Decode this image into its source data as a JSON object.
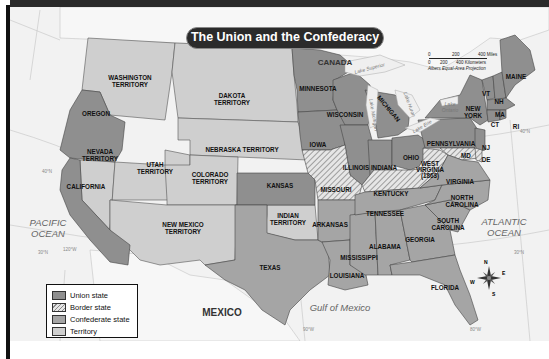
{
  "title": "The Union and the Confederacy",
  "colors": {
    "union": "#8f8f8f",
    "border": "#d6d6d6",
    "confederate": "#a5a5a5",
    "territory": "#cfcfcf",
    "water": "#f2f2f2",
    "title_bg": "#2b2b2b"
  },
  "legend": {
    "items": [
      {
        "label": "Union state",
        "swatch": "union"
      },
      {
        "label": "Border state",
        "swatch": "border-hatched"
      },
      {
        "label": "Confederate state",
        "swatch": "confederate"
      },
      {
        "label": "Territory",
        "swatch": "territory"
      }
    ]
  },
  "scale": {
    "miles_ticks": [
      "0",
      "200",
      "400 Miles"
    ],
    "km_ticks": [
      "0",
      "200",
      "400 Kilometers"
    ],
    "projection": "Albers Equal-Area Projection"
  },
  "countries": {
    "canada": "CANADA",
    "mexico": "MEXICO"
  },
  "oceans": {
    "pacific_1": "PACIFIC",
    "pacific_2": "OCEAN",
    "atlantic_1": "ATLANTIC",
    "atlantic_2": "OCEAN",
    "gulf": "Gulf of Mexico"
  },
  "lakes": {
    "superior": "Lake Superior",
    "michigan": "Lake Michigan",
    "huron": "Lake Huron",
    "erie": "Lake Erie",
    "ontario_1": "Lake",
    "ontario_2": "Ontario"
  },
  "gridlines": {
    "lat40_west": "40°N",
    "lat40_east": "40°N",
    "lat30_west": "30°N",
    "lat30_east": "30°N",
    "lon120": "120°W",
    "lon90": "90°W",
    "lon80": "80°W"
  },
  "compass": {
    "n": "N",
    "s": "S",
    "e": "E",
    "w": "W"
  },
  "regions": {
    "union": [
      "Oregon",
      "California",
      "Kansas",
      "Minnesota",
      "Iowa",
      "Wisconsin",
      "Michigan",
      "Illinois",
      "Indiana",
      "Ohio",
      "Pennsylvania",
      "New York",
      "New Jersey",
      "Vermont",
      "New Hampshire",
      "Maine",
      "Massachusetts",
      "Connecticut",
      "Rhode Island"
    ],
    "border": [
      "Missouri",
      "Kentucky",
      "West Virginia",
      "Maryland",
      "Delaware"
    ],
    "confederate": [
      "Texas",
      "Arkansas",
      "Louisiana",
      "Mississippi",
      "Alabama",
      "Tennessee",
      "Georgia",
      "Florida",
      "South Carolina",
      "North Carolina",
      "Virginia"
    ],
    "territory": [
      "Washington Territory",
      "Dakota Territory",
      "Nebraska Territory",
      "Nevada Territory",
      "Utah Territory",
      "Colorado Territory",
      "New Mexico Territory",
      "Indian Territory"
    ]
  },
  "labels": {
    "washington_1": "WASHINGTON",
    "washington_2": "TERRITORY",
    "oregon": "OREGON",
    "dakota_1": "DAKOTA",
    "dakota_2": "TERRITORY",
    "nebraska": "NEBRASKA TERRITORY",
    "nevada_1": "NEVADA",
    "nevada_2": "TERRITORY",
    "utah_1": "UTAH",
    "utah_2": "TERRITORY",
    "colorado_1": "COLORADO",
    "colorado_2": "TERRITORY",
    "california": "CALIFORNIA",
    "newmexico_1": "NEW MEXICO",
    "newmexico_2": "TERRITORY",
    "kansas": "KANSAS",
    "indian_1": "INDIAN",
    "indian_2": "TERRITORY",
    "texas": "TEXAS",
    "minnesota": "MINNESOTA",
    "wisconsin": "WISCONSIN",
    "iowa": "IOWA",
    "michigan": "MICHIGAN",
    "illinois": "ILLINOIS",
    "indiana": "INDIANA",
    "ohio": "OHIO",
    "missouri": "MISSOURI",
    "kentucky": "KENTUCKY",
    "arkansas": "ARKANSAS",
    "tennessee": "TENNESSEE",
    "mississippi": "MISSISSIPPI",
    "alabama": "ALABAMA",
    "georgia": "GEORGIA",
    "louisiana": "LOUISIANA",
    "florida": "FLORIDA",
    "southcarolina_1": "SOUTH",
    "southcarolina_2": "CAROLINA",
    "northcarolina_1": "NORTH",
    "northcarolina_2": "CAROLINA",
    "virginia": "VIRGINIA",
    "westvirginia_1": "WEST",
    "westvirginia_2": "VIRGINIA",
    "westvirginia_3": "(1863)",
    "pennsylvania": "PENNSYLVANIA",
    "newyork_1": "NEW",
    "newyork_2": "YORK",
    "nj": "NJ",
    "md": "MD",
    "de": "DE",
    "vt": "VT",
    "nh": "NH",
    "ma": "MA",
    "ct": "CT",
    "ri": "RI",
    "maine": "MAINE"
  }
}
